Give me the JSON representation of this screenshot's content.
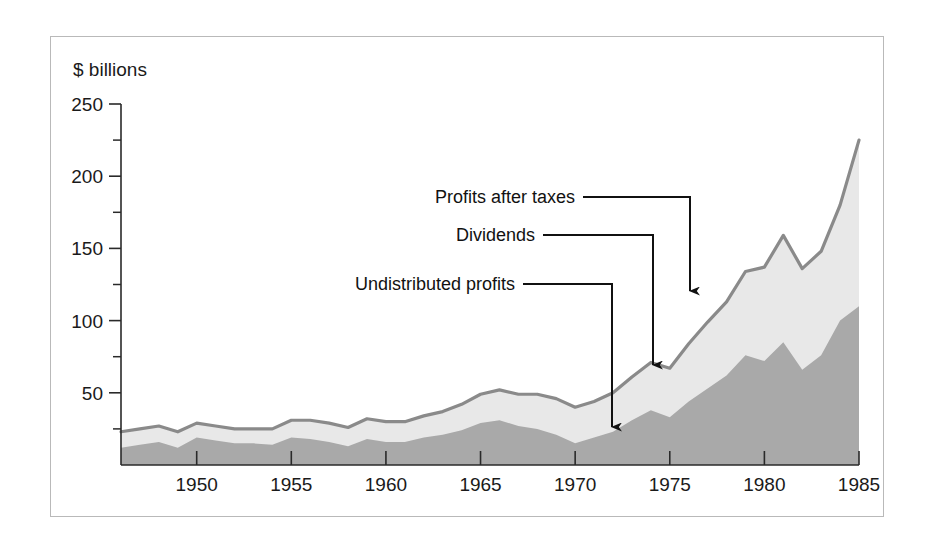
{
  "figure": {
    "axis_unit_label": "$ billions"
  },
  "chart_data": {
    "type": "area",
    "title": "",
    "subtitle": "",
    "xlabel": "",
    "ylabel": "$ billions",
    "ylim": [
      0,
      250
    ],
    "xlim": [
      1946,
      1985
    ],
    "grid": false,
    "legend_position": "inline-annotations",
    "stacked": true,
    "y_ticks_major": [
      0,
      50,
      100,
      150,
      200,
      250
    ],
    "y_tick_labels": [
      "50",
      "100",
      "150",
      "200",
      "250"
    ],
    "y_ticks_minor": [
      25,
      75,
      125,
      175,
      225
    ],
    "x_ticks": [
      1950,
      1955,
      1960,
      1965,
      1970,
      1975,
      1980,
      1985
    ],
    "x_tick_labels": [
      "1950",
      "1955",
      "1960",
      "1965",
      "1970",
      "1975",
      "1980",
      "1985"
    ],
    "x": [
      1946,
      1947,
      1948,
      1949,
      1950,
      1951,
      1952,
      1953,
      1954,
      1955,
      1956,
      1957,
      1958,
      1959,
      1960,
      1961,
      1962,
      1963,
      1964,
      1965,
      1966,
      1967,
      1968,
      1969,
      1970,
      1971,
      1972,
      1973,
      1974,
      1975,
      1976,
      1977,
      1978,
      1979,
      1980,
      1981,
      1982,
      1983,
      1984,
      1985
    ],
    "series": [
      {
        "name": "Undistributed profits",
        "fill_color": "#a9a9a9",
        "values": [
          12,
          14,
          16,
          12,
          19,
          17,
          15,
          15,
          14,
          19,
          18,
          16,
          13,
          18,
          16,
          16,
          19,
          21,
          24,
          29,
          31,
          27,
          25,
          21,
          15,
          19,
          23,
          31,
          38,
          33,
          44,
          53,
          62,
          76,
          72,
          85,
          66,
          76,
          100,
          110
        ],
        "note": "lower/darker band of the stack, plotted from the zero baseline"
      },
      {
        "name": "Dividends",
        "fill_color": "#e8e8e8",
        "values": [
          11,
          11,
          11,
          11,
          10,
          10,
          10,
          10,
          11,
          12,
          13,
          13,
          13,
          14,
          14,
          14,
          15,
          16,
          18,
          20,
          21,
          22,
          24,
          25,
          25,
          25,
          27,
          30,
          33,
          34,
          40,
          46,
          51,
          58,
          65,
          74,
          70,
          72,
          80,
          115
        ],
        "note": "upper/lighter band of the stack, drawn on top of undistributed profits"
      }
    ],
    "total_series": {
      "name": "Profits after taxes",
      "line_color": "#8a8a8a",
      "description": "top outline of the stacked area = undistributed profits + dividends",
      "values": [
        23,
        25,
        27,
        23,
        29,
        27,
        25,
        25,
        25,
        31,
        31,
        29,
        26,
        32,
        30,
        30,
        34,
        37,
        42,
        49,
        52,
        49,
        49,
        46,
        40,
        44,
        50,
        61,
        71,
        67,
        84,
        99,
        113,
        134,
        137,
        159,
        136,
        148,
        180,
        225
      ]
    },
    "annotations": [
      {
        "label": "Profits after taxes",
        "text_x": 575,
        "text_y": 203,
        "elbow_x": 690,
        "arrow_tip_x": 690,
        "arrow_tip_y": 302
      },
      {
        "label": "Dividends",
        "text_x": 535,
        "text_y": 241,
        "elbow_x": 653,
        "arrow_tip_x": 653,
        "arrow_tip_y": 376
      },
      {
        "label": "Undistributed profits",
        "text_x": 515,
        "text_y": 290,
        "elbow_x": 612,
        "arrow_tip_x": 612,
        "arrow_tip_y": 438
      }
    ],
    "colors": {
      "undistributed_profits_fill": "#a9a9a9",
      "dividends_fill": "#e8e8e8",
      "total_line": "#8a8a8a",
      "axis": "#2a2a2a",
      "text": "#1a1a1a",
      "frame_border": "#b9b9b9",
      "background": "#ffffff"
    }
  }
}
